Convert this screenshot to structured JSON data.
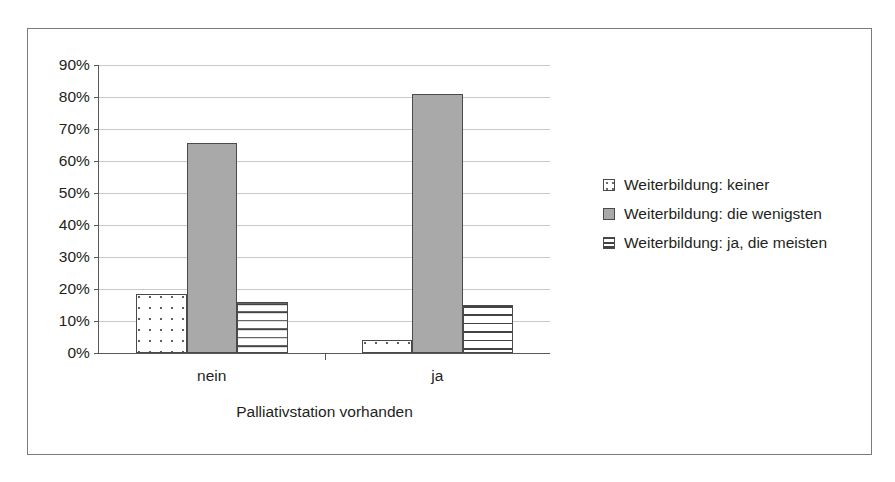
{
  "chart_data": {
    "type": "bar",
    "title": "",
    "xlabel": "Palliativstation vorhanden",
    "ylabel": "",
    "categories": [
      "nein",
      "ja"
    ],
    "series": [
      {
        "name": "Weiterbildung: keiner",
        "values": [
          18.5,
          4.0
        ]
      },
      {
        "name": "Weiterbildung: die wenigsten",
        "values": [
          65.5,
          81.0
        ]
      },
      {
        "name": "Weiterbildung: ja, die meisten",
        "values": [
          16.0,
          15.0
        ]
      }
    ],
    "ylim": [
      0,
      90
    ],
    "ytick_labels": [
      "90%",
      "80%",
      "70%",
      "60%",
      "50%",
      "40%",
      "30%",
      "20%",
      "10%",
      "0%"
    ],
    "ytick_values": [
      90,
      80,
      70,
      60,
      50,
      40,
      30,
      20,
      10,
      0
    ],
    "grid": true,
    "legend_position": "right",
    "colors": {
      "series_0_fill": "#ffffff",
      "series_1_fill": "#a9a9a9",
      "series_2_fill": "#ffffff",
      "bar_outline": "#4a4a4a",
      "gridline": "#c9c9c9",
      "axis": "#58585a",
      "frame": "#7b7b7b",
      "text": "#231f20"
    },
    "patterns": {
      "series_0": "dotted",
      "series_1": "solid",
      "series_2": "horizontal-lines"
    }
  },
  "legend": {
    "items": [
      {
        "label": "Weiterbildung: keiner"
      },
      {
        "label": "Weiterbildung: die wenigsten"
      },
      {
        "label": "Weiterbildung: ja, die meisten"
      }
    ]
  }
}
